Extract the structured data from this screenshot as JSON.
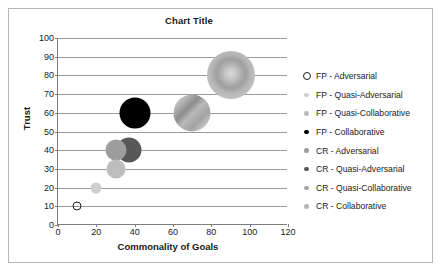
{
  "chart_data": {
    "type": "scatter",
    "title": "Chart Title",
    "xlabel": "Commonality of Goals",
    "ylabel": "Trust",
    "xlim": [
      0,
      120
    ],
    "ylim": [
      0,
      100
    ],
    "xticks": [
      "0",
      "20",
      "40",
      "60",
      "80",
      "100",
      "120"
    ],
    "yticks": [
      "0",
      "10",
      "20",
      "30",
      "40",
      "50",
      "60",
      "70",
      "80",
      "90",
      "100"
    ],
    "grid": "horizontal",
    "legend_position": "right",
    "series": [
      {
        "name": "FP - Adversarial",
        "x": 10,
        "y": 10,
        "size": 7,
        "style": "hollow",
        "color": "#1d1d1d"
      },
      {
        "name": "FP - Quasi-Adversarial",
        "x": 20,
        "y": 20,
        "size": 11,
        "style": "solid-light",
        "color": "#cfcfcf"
      },
      {
        "name": "FP - Quasi-Collaborative",
        "x": 30,
        "y": 30,
        "size": 19,
        "style": "solid-light",
        "color": "#bdbdbd"
      },
      {
        "name": "FP - Collaborative",
        "x": 40,
        "y": 60,
        "size": 31,
        "style": "solid-black",
        "color": "#000000"
      },
      {
        "name": "CR - Adversarial",
        "x": 30,
        "y": 40,
        "size": 21,
        "style": "solid-mid",
        "color": "#9d9d9d"
      },
      {
        "name": "CR - Quasi-Adversarial",
        "x": 37,
        "y": 40,
        "size": 25,
        "style": "solid-dark",
        "color": "#585858"
      },
      {
        "name": "CR - Quasi-Collaborative",
        "x": 70,
        "y": 60,
        "size": 37,
        "style": "diagonal",
        "color": "#a6a6a6"
      },
      {
        "name": "CR - Collaborative",
        "x": 90,
        "y": 80,
        "size": 48,
        "style": "radial",
        "color": "#b5b5b5"
      }
    ]
  }
}
